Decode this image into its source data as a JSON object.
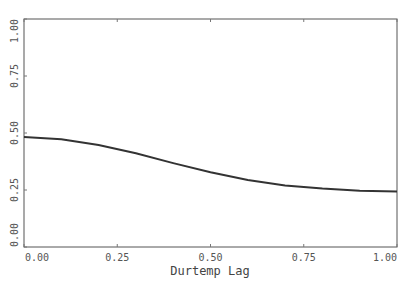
{
  "chart_data": {
    "type": "line",
    "title": "",
    "xlabel": "Durtemp Lag",
    "ylabel": "",
    "xlim": [
      0,
      1
    ],
    "ylim": [
      0,
      1
    ],
    "xticks": [
      "0.00",
      "0.25",
      "0.50",
      "0.75",
      "1.00"
    ],
    "yticks": [
      "0.00",
      "0.25",
      "0.50",
      "0.75",
      "1.00"
    ],
    "grid": false,
    "series": [
      {
        "name": "curve",
        "color": "#333333",
        "x": [
          0.0,
          0.1,
          0.2,
          0.3,
          0.4,
          0.5,
          0.6,
          0.7,
          0.8,
          0.9,
          1.0
        ],
        "y": [
          0.482,
          0.473,
          0.448,
          0.411,
          0.368,
          0.328,
          0.294,
          0.27,
          0.256,
          0.247,
          0.243
        ]
      }
    ]
  }
}
